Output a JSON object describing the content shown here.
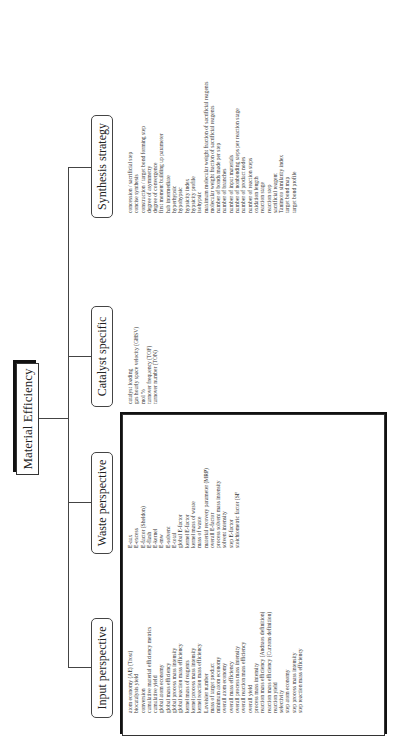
{
  "diagram": {
    "root": {
      "label": "Material Efficiency"
    },
    "categories": [
      {
        "label": "Input perspective",
        "items": [
          "atom economy (AE) (Trost)",
          "biocatalysis yield",
          "conversion",
          "cumulative material efficiency metrics",
          "cumulative yield",
          "global atom economy",
          "global mass efficiency",
          "global process mass intensity",
          "global reaction mass efficiency",
          "kernel mass of reagents",
          "kernel process mass intensity",
          "kernel reaction mass efficiency",
          "Lavoisier number",
          "mass of target product",
          "minimum atom economy",
          "overall atom economy",
          "overall mass efficiency",
          "overall process mass intensity",
          "overall reaction mass efficiency",
          "overall yield",
          "process mass intensity",
          "reaction mass efficiency (Andraos definition)",
          "reaction mass efficiency (Curzons definition)",
          "reaction yield",
          "selectivity",
          "step atom economy",
          "step process mass intensity",
          "step reaction mass efficiency"
        ]
      },
      {
        "label": "Waste perspective",
        "items": [
          "E-aux",
          "E-excess",
          "E-factor (Sheldon)",
          "E-flash",
          "E-kernel",
          "E-mw",
          "E-solvent",
          "E-total",
          "global E-factor",
          "kernel E-factor",
          "kernel mass of waste",
          "mass of waste",
          "material recovery parameter (MRP)",
          "overall E-factor",
          "process solvent mass intensity",
          "solvent intensity",
          "step E-factor",
          "stoichiometric factor (SF"
        ]
      },
      {
        "label": "Catalyst specific",
        "items": [
          "catalyst loading",
          "gas hourly space velocity (GHSV)",
          "mol %",
          "turnover frequency (TOF)",
          "turnover number (TON)"
        ]
      },
      {
        "label": "Synthesis strategy",
        "items": [
          "concession / sacrificial step",
          "concise synthesis",
          "construction / target bond forming step",
          "degree of asymmetry",
          "degree of convergence",
          "first moment building up parameter",
          "hub intermediate",
          "hyperhypsic",
          "hypohypsic",
          "hypsicity index",
          "hypsicity profile",
          "isohypsic",
          "maximum molecular weight fraction of sacrificial reagents",
          "molecular weight fraction of sacrificial reagents",
          "number of bonds made per step",
          "number of branches",
          "number of input materials",
          "number of nonbonding steps per reaction stage",
          "number of product nodes",
          "number of reaction steps",
          "oxidation length",
          "reaction stage",
          "reaction step",
          "sacrificial reagent",
          "Tanimoto similarity index",
          "target bond map",
          "target bond profile"
        ]
      }
    ]
  }
}
